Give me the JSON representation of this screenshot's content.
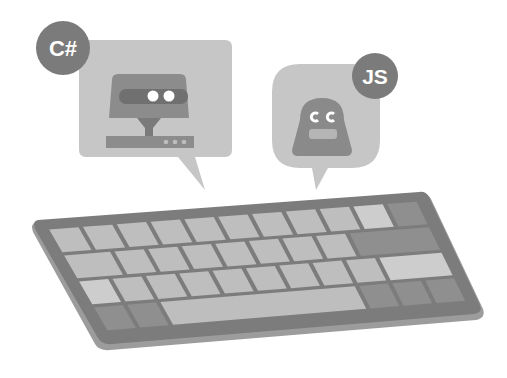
{
  "illustration": {
    "description": "Grayscale illustration of a keyboard with two chat bubbles containing bot faces",
    "csharp_bubble": {
      "badge_label": "C#"
    },
    "js_bubble": {
      "badge_label": "JS"
    }
  },
  "colors": {
    "bubble_light": "#c4c4c4",
    "bot_dark": "#8a8a8a",
    "bot_darker": "#6e6e6e",
    "badge": "#7a7a7a",
    "keyboard_frame": "#7d7d7d",
    "keyboard_frame_edge": "#9a9a9a",
    "key_light": "#bdbdbd",
    "key_lighter": "#cccccc",
    "key_dark": "#8f8f8f",
    "eye": "#ffffff"
  }
}
